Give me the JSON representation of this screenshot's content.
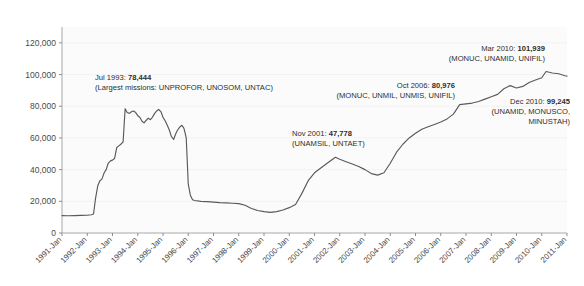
{
  "chart_data": {
    "type": "line",
    "title": "",
    "subtitle": "",
    "xlabel": "",
    "ylabel": "",
    "ylim": [
      0,
      130000
    ],
    "xlim": [
      "1991-Jan",
      "2011-Jan"
    ],
    "grid": true,
    "legend_position": "none",
    "line_color": "#5a5a5a",
    "plot_background": "#fbfbfb",
    "yticks": [
      0,
      20000,
      40000,
      60000,
      80000,
      100000,
      120000
    ],
    "ytick_labels": [
      "0",
      "20,000",
      "40,000",
      "60,000",
      "80,000",
      "100,000",
      "120,000"
    ],
    "xtick_labels": [
      "1991-Jan",
      "1992-Jan",
      "1993-Jan",
      "1994-Jan",
      "1995-Jan",
      "1996-Jan",
      "1997-Jan",
      "1998-Jan",
      "1999-Jan",
      "2000-Jan",
      "2001-Jan",
      "2002-Jan",
      "2003-Jan",
      "2004-Jan",
      "2005-Jan",
      "2006-Jan",
      "2007-Jan",
      "2008-Jan",
      "2009-Jan",
      "2010-Jan",
      "2011-Jan"
    ],
    "series": [
      {
        "name": "UN peacekeeping personnel",
        "x": [
          1991.0,
          1991.25,
          1991.5,
          1991.75,
          1992.0,
          1992.17,
          1992.25,
          1992.33,
          1992.42,
          1992.5,
          1992.58,
          1992.67,
          1992.75,
          1992.83,
          1992.92,
          1993.0,
          1993.08,
          1993.17,
          1993.25,
          1993.33,
          1993.42,
          1993.5,
          1993.58,
          1993.67,
          1993.75,
          1993.83,
          1993.92,
          1994.0,
          1994.08,
          1994.17,
          1994.25,
          1994.33,
          1994.42,
          1994.5,
          1994.58,
          1994.67,
          1994.75,
          1994.83,
          1994.92,
          1995.0,
          1995.08,
          1995.17,
          1995.25,
          1995.33,
          1995.42,
          1995.5,
          1995.58,
          1995.67,
          1995.75,
          1995.83,
          1995.92,
          1996.0,
          1996.08,
          1996.17,
          1996.25,
          1996.5,
          1996.75,
          1997.0,
          1997.25,
          1997.5,
          1997.75,
          1998.0,
          1998.25,
          1998.5,
          1998.75,
          1999.0,
          1999.25,
          1999.5,
          1999.75,
          2000.0,
          2000.25,
          2000.5,
          2000.75,
          2001.0,
          2001.25,
          2001.5,
          2001.83,
          2002.0,
          2002.25,
          2002.5,
          2002.75,
          2003.0,
          2003.25,
          2003.5,
          2003.75,
          2004.0,
          2004.25,
          2004.5,
          2004.75,
          2005.0,
          2005.25,
          2005.5,
          2005.75,
          2006.0,
          2006.25,
          2006.5,
          2006.75,
          2007.0,
          2007.25,
          2007.5,
          2007.75,
          2008.0,
          2008.25,
          2008.5,
          2008.75,
          2009.0,
          2009.25,
          2009.5,
          2009.75,
          2010.0,
          2010.17,
          2010.42,
          2010.67,
          2010.92,
          2011.0
        ],
        "y": [
          11000,
          10900,
          11000,
          11100,
          11200,
          11500,
          12000,
          22000,
          30000,
          33000,
          34000,
          38000,
          40000,
          44000,
          45500,
          46000,
          47000,
          54000,
          55000,
          56000,
          57500,
          78444,
          76000,
          75500,
          76500,
          77000,
          76000,
          74000,
          73000,
          70500,
          69500,
          71000,
          72500,
          71500,
          73000,
          75500,
          77000,
          78000,
          76500,
          73000,
          71000,
          68000,
          65000,
          61000,
          59000,
          62500,
          65000,
          67000,
          68000,
          66000,
          60000,
          31000,
          24000,
          21000,
          20500,
          20000,
          19800,
          19500,
          19200,
          19000,
          18800,
          18500,
          17500,
          15500,
          14200,
          13500,
          13000,
          13500,
          14500,
          16000,
          18000,
          25000,
          33000,
          38000,
          41000,
          44000,
          47778,
          46500,
          45000,
          43500,
          42000,
          40000,
          37500,
          36500,
          38000,
          44000,
          51000,
          56000,
          60000,
          63000,
          65500,
          67000,
          68500,
          70000,
          72000,
          75000,
          80976,
          81500,
          82000,
          83000,
          84500,
          86000,
          87500,
          91000,
          93000,
          91500,
          92500,
          95000,
          96500,
          98000,
          101939,
          101000,
          100500,
          99245,
          99000
        ]
      }
    ],
    "annotations": [
      {
        "id": "jul-1993",
        "date": "Jul 1993",
        "value": "78,444",
        "line1_prefix": "Jul 1993: ",
        "line1_value": "78,444",
        "line2": "(Largest missions: UNPROFOR, UNOSOM, UNTAC)",
        "align": "left"
      },
      {
        "id": "nov-2001",
        "date": "Nov 2001",
        "value": "47,778",
        "line1_prefix": "Nov 2001: ",
        "line1_value": "47,778",
        "line2": "(UNAMSIL, UNTAET)",
        "align": "left"
      },
      {
        "id": "oct-2006",
        "date": "Oct 2006",
        "value": "80,976",
        "line1_prefix": "Oct 2006: ",
        "line1_value": "80,976",
        "line2": "(MONUC, UNMIL, UNMIS, UNIFIL)",
        "align": "right"
      },
      {
        "id": "mar-2010",
        "date": "Mar 2010",
        "value": "101,939",
        "line1_prefix": "Mar 2010: ",
        "line1_value": "101,939",
        "line2": "(MONUC, UNAMID, UNIFIL)",
        "align": "right"
      },
      {
        "id": "dec-2010",
        "date": "Dec 2010",
        "value": "99,245",
        "line1_prefix": "Dec 2010: ",
        "line1_value": "99,245",
        "line2": "(UNAMID, MONUSCO,",
        "line3": "MINUSTAH)",
        "align": "right"
      }
    ]
  }
}
